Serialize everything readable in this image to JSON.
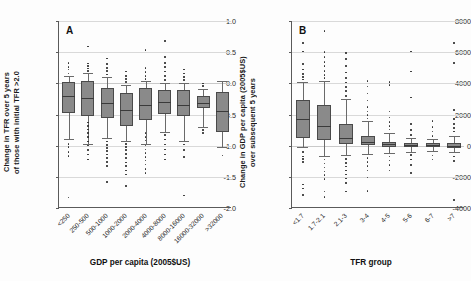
{
  "figure": {
    "panels": [
      "A",
      "B"
    ]
  },
  "chart_data": [
    {
      "panel": "A",
      "type": "boxplot",
      "title": "A",
      "xlabel": "GDP per capita (2005$US)",
      "ylabel_line1": "Change in TFR over 5 years",
      "ylabel_line2": "of those with initial TFR >2.0",
      "ylim": [
        -2.0,
        1.0
      ],
      "yticks": [
        "1.0",
        "0.5",
        "0.0",
        "-0.5",
        "-1.0",
        "-1.5",
        "-2.0"
      ],
      "ytickvals": [
        1.0,
        0.5,
        0.0,
        -0.5,
        -1.0,
        -1.5,
        -2.0
      ],
      "grid": true,
      "categories": [
        "<250",
        "250-500",
        "500-1000",
        "1000-2000",
        "2000-4000",
        "4000-8000",
        "8000-16000",
        "16000-32000",
        ">32000"
      ],
      "boxes": [
        {
          "category": "<250",
          "whisker_low": -0.9,
          "q1": -0.47,
          "median": -0.21,
          "q3": 0.02,
          "whisker_high": 0.12,
          "outliers": [
            0.16,
            0.22,
            0.26,
            0.33,
            -0.97,
            -1.02,
            -1.1,
            -1.17,
            -1.83
          ]
        },
        {
          "category": "250-500",
          "whisker_low": -0.97,
          "q1": -0.52,
          "median": -0.23,
          "q3": 0.03,
          "whisker_high": 0.17,
          "outliers": [
            0.2,
            0.24,
            0.28,
            0.32,
            0.59,
            -0.63,
            -0.68,
            -0.74,
            -0.8,
            -0.86,
            -0.93,
            -1.0,
            -1.07,
            -1.14,
            -1.22
          ]
        },
        {
          "category": "500-1000",
          "whisker_low": -0.88,
          "q1": -0.55,
          "median": -0.32,
          "q3": -0.07,
          "whisker_high": 0.1,
          "outliers": [
            0.14,
            0.2,
            0.25,
            0.31,
            0.4,
            -0.93,
            -0.99,
            -1.04,
            -1.09,
            -1.14,
            -1.2,
            -1.26,
            -1.33,
            -1.58
          ]
        },
        {
          "category": "1000-2000",
          "whisker_low": -0.92,
          "q1": -0.69,
          "median": -0.43,
          "q3": -0.16,
          "whisker_high": -0.02,
          "outliers": [
            0.02,
            0.07,
            0.12,
            0.19,
            -0.97,
            -1.02,
            -1.07,
            -1.13,
            -1.2,
            -1.27,
            -1.33,
            -1.4,
            -1.46,
            -1.65
          ]
        },
        {
          "category": "2000-4000",
          "whisker_low": -0.98,
          "q1": -0.59,
          "median": -0.34,
          "q3": -0.07,
          "whisker_high": 0.03,
          "outliers": [
            0.07,
            0.12,
            0.18,
            0.25,
            0.53,
            -0.8,
            -0.86,
            -0.92,
            -1.0,
            -1.06,
            -1.12,
            -1.18,
            -1.24,
            -1.3,
            -1.37,
            -1.44
          ]
        },
        {
          "category": "4000-8000",
          "whisker_low": -0.78,
          "q1": -0.49,
          "median": -0.3,
          "q3": -0.1,
          "whisker_high": 0.0,
          "outliers": [
            0.05,
            0.12,
            0.19,
            0.26,
            0.33,
            0.42,
            0.68,
            -0.83,
            -0.9,
            -0.98,
            -1.06,
            -1.14,
            -1.22
          ]
        },
        {
          "category": "8000-16000",
          "whisker_low": -0.93,
          "q1": -0.53,
          "median": -0.34,
          "q3": -0.1,
          "whisker_high": 0.01,
          "outliers": [
            0.05,
            0.1,
            0.16,
            0.22,
            -0.98,
            -1.07,
            -1.18,
            -1.8
          ]
        },
        {
          "category": "16000-32000",
          "whisker_low": -0.7,
          "q1": -0.4,
          "median": -0.32,
          "q3": -0.21,
          "whisker_high": -0.09,
          "outliers": [
            -0.04,
            0.0,
            -0.75,
            -0.8
          ]
        },
        {
          "category": ">32000",
          "whisker_low": -1.02,
          "q1": -0.78,
          "median": -0.44,
          "q3": -0.14,
          "whisker_high": 0.04,
          "outliers": [
            -1.16
          ]
        }
      ]
    },
    {
      "panel": "B",
      "type": "boxplot",
      "title": "B",
      "xlabel": "TFR group",
      "ylabel_line1": "Change in GDP per capita (2005$US)",
      "ylabel_line2": "over subsequent 5 years",
      "ylim": [
        -4000,
        8000
      ],
      "yticks": [
        "8000",
        "6000",
        "4000",
        "2000",
        "0",
        "-2000",
        "-4000"
      ],
      "ytickvals": [
        8000,
        6000,
        4000,
        2000,
        0,
        -2000,
        -4000
      ],
      "grid": true,
      "categories": [
        "<1.7",
        "1.7-2.1",
        "2.1-3",
        "3-4",
        "4-5",
        "5-6",
        "6-7",
        ">7"
      ],
      "boxes": [
        {
          "category": "<1.7",
          "whisker_low": -100,
          "q1": 480,
          "median": 1700,
          "q3": 2900,
          "whisker_high": 4080,
          "outliers": [
            4250,
            4400,
            4600,
            4900,
            5250,
            6050,
            6600,
            -400,
            -700,
            -850,
            -1050,
            -2500,
            -2750,
            -3150
          ]
        },
        {
          "category": "1.7-2.1",
          "whisker_low": -650,
          "q1": 350,
          "median": 1290,
          "q3": 2580,
          "whisker_high": 4150,
          "outliers": [
            4350,
            4550,
            4800,
            5100,
            5350,
            5700,
            6000,
            7350,
            -900,
            -1150,
            -1400,
            -1650,
            -1900,
            -2150,
            -2950,
            -3300
          ]
        },
        {
          "category": "2.1-3",
          "whisker_low": -600,
          "q1": 100,
          "median": 520,
          "q3": 1400,
          "whisker_high": 2980,
          "outliers": [
            3200,
            3500,
            3750,
            4050,
            4350,
            4700,
            5100,
            5550,
            5950,
            -850,
            -1100,
            -1350,
            -1600,
            -1850,
            -2100,
            -2400,
            -2950
          ]
        },
        {
          "category": "3-4",
          "whisker_low": -560,
          "q1": 20,
          "median": 260,
          "q3": 640,
          "whisker_high": 1560,
          "outliers": [
            1750,
            1950,
            2200,
            2500,
            2900,
            3350,
            3800,
            4150,
            -800,
            -1050,
            -1300,
            -1600,
            -2050,
            -2900
          ]
        },
        {
          "category": "4-5",
          "whisker_low": -450,
          "q1": -70,
          "median": 80,
          "q3": 260,
          "whisker_high": 820,
          "outliers": [
            1050,
            1250,
            1500,
            1800,
            2200,
            3900,
            4100,
            -700,
            -950,
            -1250,
            -1600
          ]
        },
        {
          "category": "5-6",
          "whisker_low": -380,
          "q1": -110,
          "median": 40,
          "q3": 180,
          "whisker_high": 470,
          "outliers": [
            700,
            1000,
            1400,
            3100,
            4750,
            6050,
            -600,
            -900,
            -1250,
            -1750
          ]
        },
        {
          "category": "6-7",
          "whisker_low": -350,
          "q1": -90,
          "median": 20,
          "q3": 140,
          "whisker_high": 400,
          "outliers": [
            620,
            900,
            1200,
            1600,
            -620,
            -880
          ]
        },
        {
          "category": ">7",
          "whisker_low": -400,
          "q1": -120,
          "median": 10,
          "q3": 160,
          "whisker_high": 650,
          "outliers": [
            900,
            1150,
            1400,
            1700,
            2300,
            5300,
            6600,
            -700,
            -1000,
            -3500
          ]
        }
      ]
    }
  ]
}
